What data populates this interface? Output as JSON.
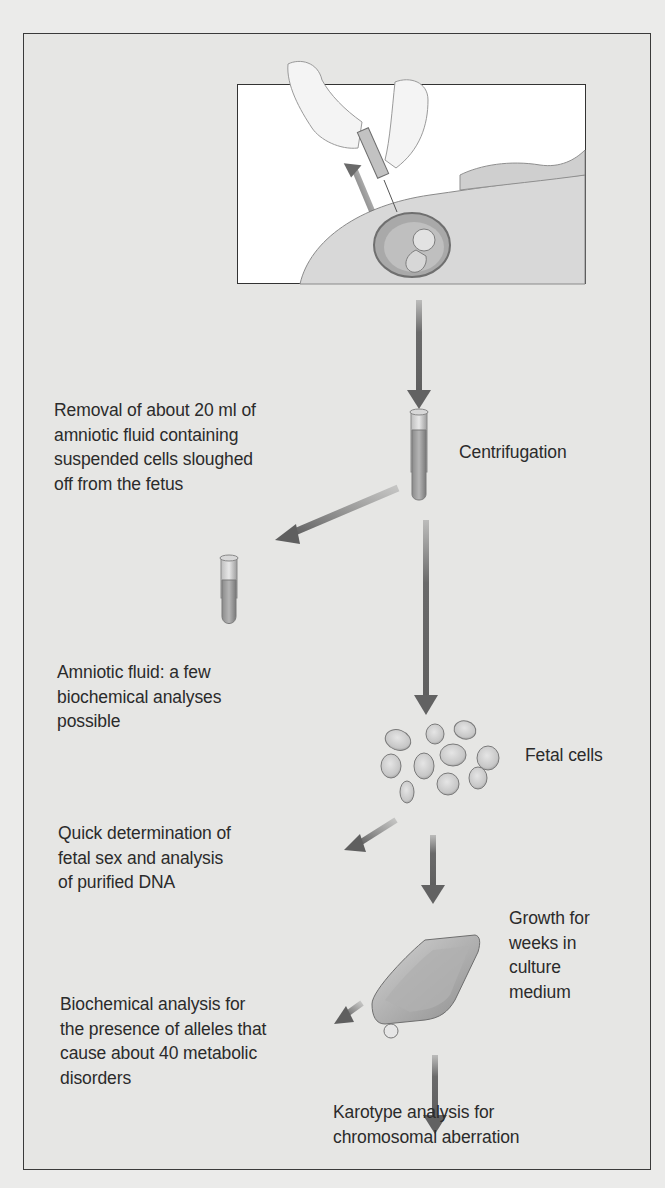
{
  "figure": {
    "steps": {
      "removal": "Removal of about 20 ml of\namniotic fluid containing\nsuspended cells sloughed\noff from the fetus",
      "centrifugation": "Centrifugation",
      "amniotic_fluid": "Amniotic fluid: a few\nbiochemical analyses\npossible",
      "fetal_cells": "Fetal cells",
      "quick_determination": "Quick determination of\nfetal sex and analysis\nof purified DNA",
      "growth": "Growth for\nweeks in\nculture\nmedium",
      "biochemical_analysis": "Biochemical analysis for\nthe presence of alleles that\ncause about 40 metabolic\ndisorders",
      "karyotype": "Karotype analysis for\nchromosomal aberration"
    },
    "icons": {
      "illustration": "syringe-abdomen-illustration",
      "tube_full": "test-tube-icon",
      "tube_supernatant": "test-tube-icon",
      "cells": "fetal-cells-icon",
      "flask": "culture-flask-icon"
    },
    "colors": {
      "background": "#e6e6e4",
      "border": "#333333",
      "arrow": "#6b6b6b",
      "text": "#2b2b2b"
    }
  }
}
